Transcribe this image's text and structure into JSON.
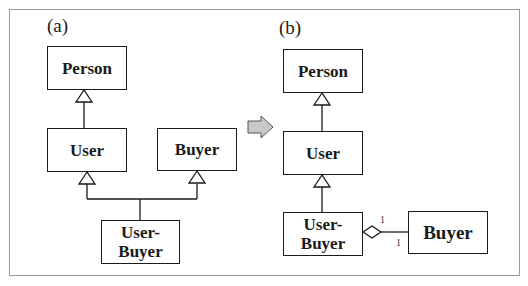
{
  "diagram": {
    "type": "UML class diagram",
    "panels": [
      {
        "label": "(a)",
        "classes": {
          "person": "Person",
          "user": "User",
          "buyer": "Buyer",
          "user_buyer": "User-\nBuyer"
        },
        "relations": [
          {
            "from": "User",
            "to": "Person",
            "type": "generalization"
          },
          {
            "from": "User-Buyer",
            "to": "User",
            "type": "generalization"
          },
          {
            "from": "User-Buyer",
            "to": "Buyer",
            "type": "generalization"
          }
        ]
      },
      {
        "label": "(b)",
        "classes": {
          "person": "Person",
          "user": "User",
          "user_buyer": "User-\nBuyer",
          "buyer": "Buyer"
        },
        "relations": [
          {
            "from": "User",
            "to": "Person",
            "type": "generalization"
          },
          {
            "from": "User-Buyer",
            "to": "User",
            "type": "generalization"
          },
          {
            "from": "User-Buyer",
            "to": "Buyer",
            "type": "aggregation",
            "multiplicity_source": "1",
            "multiplicity_target": "1"
          }
        ]
      }
    ],
    "transition_arrow": "right-arrow",
    "multiplicities": {
      "upper": "1",
      "lower": "1"
    },
    "colors": {
      "stroke": "#1a1a1a",
      "frame": "#9a9a9a",
      "arrow_fill": "#c8c8c8"
    }
  }
}
